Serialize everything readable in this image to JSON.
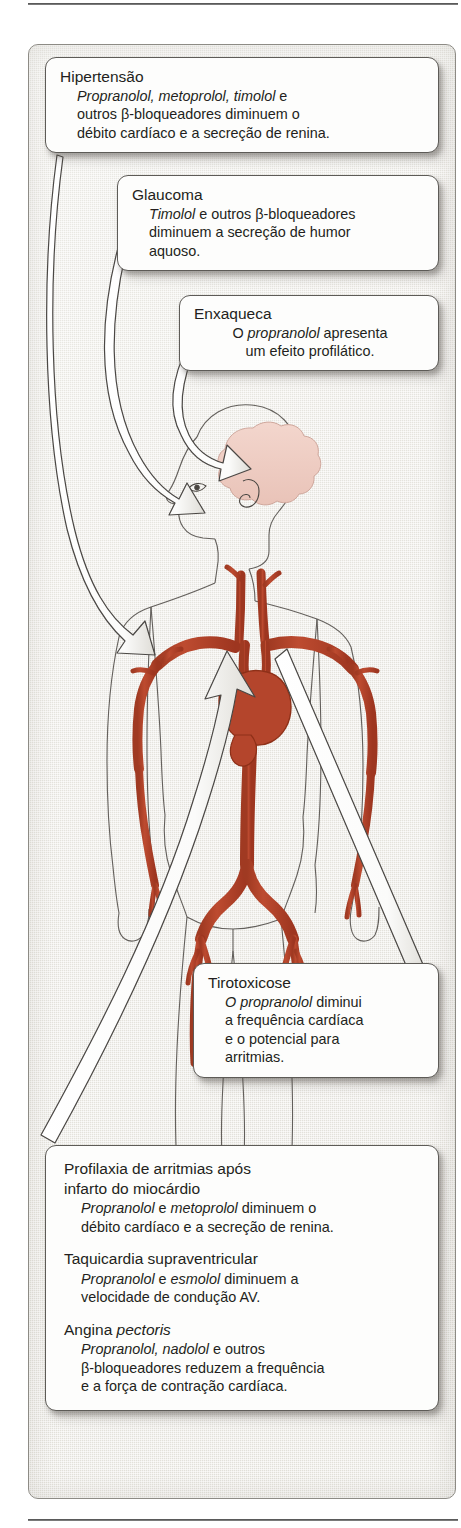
{
  "figure": {
    "illustration": {
      "body_outline_color": "#3a3734",
      "artery_color": "#b4452c",
      "artery_shade_color": "#8e3018",
      "brain_color": "#f0cfc6",
      "arrow_fill": "#ffffff",
      "arrow_stroke": "#4a4744",
      "background_color": "#edebe5",
      "parts": [
        "cabeca-perfil",
        "cerebro",
        "olho",
        "orelha",
        "coracao",
        "aorta",
        "arterias-carotidas",
        "arterias-subclavias",
        "arterias-braquiais",
        "arterias-iliacas",
        "arterias-femorais",
        "pernas",
        "bracos"
      ]
    }
  },
  "callouts": {
    "hipertensao": {
      "title": "Hipertensão",
      "line1_italic": "Propranolol, metoprolol, timolol",
      "line1_rest": " e",
      "line2": "outros β-bloqueadores diminuem o",
      "line3": "débito cardíaco e a secreção de renina."
    },
    "glaucoma": {
      "title": "Glaucoma",
      "line1_italic": "Timolol",
      "line1_rest": " e outros β-bloqueadores",
      "line2": "diminuem a secreção de humor",
      "line3": "aquoso."
    },
    "enxaqueca": {
      "title": "Enxaqueca",
      "line1_pre": "O ",
      "line1_italic": "propranolol",
      "line1_rest": " apresenta",
      "line2": "um efeito profilático."
    },
    "tirotoxicose": {
      "title": "Tirotoxicose",
      "line1_italic": "O propranolol",
      "line1_rest": " diminui",
      "line2": "a frequência cardíaca",
      "line3": "e o potencial para",
      "line4": "arritmias."
    },
    "bottom": {
      "sections": [
        {
          "title_line1": "Profilaxia de arritmias após",
          "title_line2": "infarto do miocárdio",
          "body_italic": "Propranolol",
          "body_mid": " e ",
          "body_italic2": "metoprolol",
          "body_rest": " diminuem o",
          "body_line2": "débito cardíaco e a secreção de renina."
        },
        {
          "title_line1": "Taquicardia supraventricular",
          "title_line2": "",
          "body_italic": "Propranolol",
          "body_mid": "  e ",
          "body_italic2": "esmolol",
          "body_rest": " diminuem a",
          "body_line2": "velocidade de condução AV."
        },
        {
          "title_line1": "Angina ",
          "title_line1_italic": "pectoris",
          "title_line2": "",
          "body_italic": "Propranolol, nadolol",
          "body_mid": "",
          "body_italic2": "",
          "body_rest": " e outros",
          "body_line2": "β-bloqueadores reduzem a frequência",
          "body_line3": "e a força de contração cardíaca."
        }
      ]
    }
  },
  "arrows": [
    {
      "name": "arrow-hipertensao-to-heart",
      "from": "box-hipertensao",
      "to": "coracao"
    },
    {
      "name": "arrow-glaucoma-to-eye",
      "from": "box-glaucoma",
      "to": "olho"
    },
    {
      "name": "arrow-enxaqueca-to-brain",
      "from": "box-enxaqueca",
      "to": "cerebro"
    },
    {
      "name": "arrow-tirotoxicose-to-heart",
      "from": "coracao",
      "to": "box-tirotoxicose"
    },
    {
      "name": "arrow-bottom-to-heart",
      "from": "box-bottom",
      "to": "coracao"
    }
  ]
}
